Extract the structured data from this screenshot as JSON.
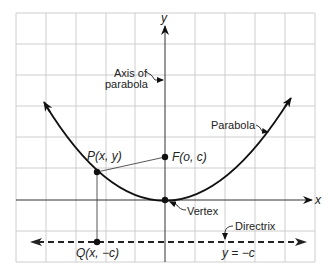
{
  "diagram": {
    "axes": {
      "x_label": "x",
      "y_label": "y"
    },
    "labels": {
      "axis_of_parabola_line1": "Axis of",
      "axis_of_parabola_line2": "parabola",
      "parabola": "Parabola",
      "point_p": "P(x, y)",
      "focus": "F(o, c)",
      "vertex": "Vertex",
      "directrix": "Directrix",
      "directrix_eq": "y  =  −c",
      "point_q": "Q(x, −c)"
    },
    "grid": {
      "x_lines": [
        16,
        46,
        76,
        106,
        135,
        165,
        195,
        225,
        255,
        285,
        315
      ],
      "y_lines": [
        13,
        44,
        75,
        106,
        137,
        168,
        200,
        231,
        262
      ]
    },
    "points": {
      "vertex": [
        165,
        200
      ],
      "focus": [
        165,
        157
      ],
      "p": [
        97,
        172
      ],
      "q": [
        97,
        242
      ]
    },
    "colors": {
      "ink": "#111111",
      "grid": "#c8c8c8",
      "axis": "#333333"
    }
  }
}
